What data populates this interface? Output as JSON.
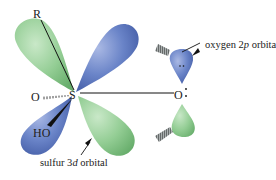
{
  "diagram": {
    "type": "orbital-overlap",
    "atoms": {
      "sulfur": "S",
      "oxygen_right": "O",
      "oxygen_left": "O",
      "r_group": "R",
      "hydroxyl": "HO"
    },
    "lone_pair_glyph": ":",
    "labels": {
      "oxygen_orbital": {
        "prefix": "oxygen 2",
        "italic": "p",
        "suffix": " orbital"
      },
      "sulfur_orbital": {
        "prefix": "sulfur 3",
        "italic": "d",
        "suffix": " orbital"
      }
    },
    "colors": {
      "green_lobe": "#8cc98e",
      "green_lobe_dark": "#5fa865",
      "blue_lobe": "#5b78c0",
      "blue_lobe_dark": "#3b559e",
      "bond": "#111111",
      "text": "#222222"
    }
  }
}
